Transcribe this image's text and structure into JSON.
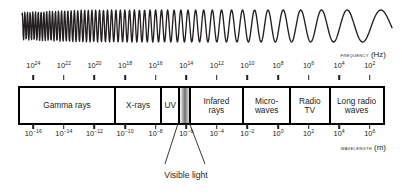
{
  "figure": {
    "frequency_axis": {
      "label_text": "Frequency",
      "label_unit": "(Hz)",
      "exponents": [
        24,
        22,
        20,
        18,
        16,
        14,
        12,
        10,
        8,
        6,
        4,
        2
      ],
      "base": "10"
    },
    "wavelength_axis": {
      "label_text": "Wavelength",
      "label_unit": "(m)",
      "exponents": [
        -16,
        -14,
        -12,
        -10,
        -8,
        -6,
        -4,
        -2,
        0,
        2,
        4,
        6
      ],
      "base": "10"
    },
    "bands": [
      {
        "name": "gamma-rays",
        "label": "Gamma rays",
        "start": 0.0,
        "end": 0.259,
        "visible_light": false
      },
      {
        "name": "x-rays",
        "label": "X-rays",
        "start": 0.259,
        "end": 0.387,
        "visible_light": false
      },
      {
        "name": "ultraviolet",
        "label": "UV",
        "start": 0.387,
        "end": 0.436,
        "visible_light": false
      },
      {
        "name": "visible-light",
        "label": "",
        "start": 0.436,
        "end": 0.465,
        "visible_light": true
      },
      {
        "name": "infrared",
        "label": "Infared rays",
        "start": 0.465,
        "end": 0.613,
        "visible_light": false
      },
      {
        "name": "microwaves",
        "label": "Micro-waves",
        "start": 0.613,
        "end": 0.742,
        "visible_light": false
      },
      {
        "name": "radio-tv",
        "label": "Radio TV",
        "start": 0.742,
        "end": 0.851,
        "visible_light": false
      },
      {
        "name": "long-radio",
        "label": "Long radio waves",
        "start": 0.851,
        "end": 1.0,
        "visible_light": false
      }
    ],
    "annotation": {
      "caption": "Visible light"
    },
    "colors": {
      "ink": "#231f20",
      "bar_border": "#000000",
      "background": "#ffffff"
    }
  },
  "chart_data": {
    "type": "diagram",
    "xlabel_top": "FREQUENCY (Hz)",
    "xlabel_bottom": "WAVELENGTH (m)",
    "frequency_ticks_hz": [
      "10^24",
      "10^22",
      "10^20",
      "10^18",
      "10^16",
      "10^14",
      "10^12",
      "10^10",
      "10^8",
      "10^6",
      "10^4",
      "10^2"
    ],
    "wavelength_ticks_m": [
      "10^-16",
      "10^-14",
      "10^-12",
      "10^-10",
      "10^-8",
      "10^-6",
      "10^-4",
      "10^-2",
      "10^0",
      "10^2",
      "10^4",
      "10^6"
    ],
    "bands": [
      "Gamma rays",
      "X-rays",
      "UV",
      "Visible light",
      "Infared rays",
      "Micro-waves",
      "Radio TV",
      "Long radio waves"
    ],
    "annotations": [
      "Visible light"
    ],
    "grid": false,
    "legend": "none"
  }
}
